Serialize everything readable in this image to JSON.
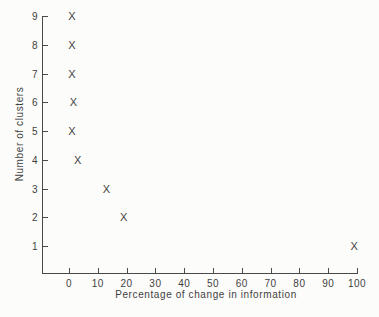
{
  "chart_data": {
    "type": "scatter",
    "title": "",
    "xlabel": "Percentage of change in information",
    "ylabel": "Number of clusters",
    "marker_glyph": "X",
    "x_ticks": [
      0,
      10,
      20,
      30,
      40,
      50,
      60,
      70,
      80,
      90,
      100
    ],
    "y_ticks": [
      1,
      2,
      3,
      4,
      5,
      6,
      7,
      8,
      9
    ],
    "xlim": [
      -9.4,
      100.2
    ],
    "ylim": [
      0.05,
      9
    ],
    "grid": false,
    "legend": null,
    "points": [
      {
        "x": 1,
        "y": 9
      },
      {
        "x": 1,
        "y": 8
      },
      {
        "x": 1,
        "y": 7
      },
      {
        "x": 1.5,
        "y": 6
      },
      {
        "x": 1,
        "y": 5
      },
      {
        "x": 3,
        "y": 4
      },
      {
        "x": 13,
        "y": 3
      },
      {
        "x": 19,
        "y": 2
      },
      {
        "x": 99,
        "y": 1
      }
    ]
  },
  "colors": {
    "background": "#fcfcfa",
    "ink": "#3f3f3f",
    "axis": "#4a4a4a"
  }
}
